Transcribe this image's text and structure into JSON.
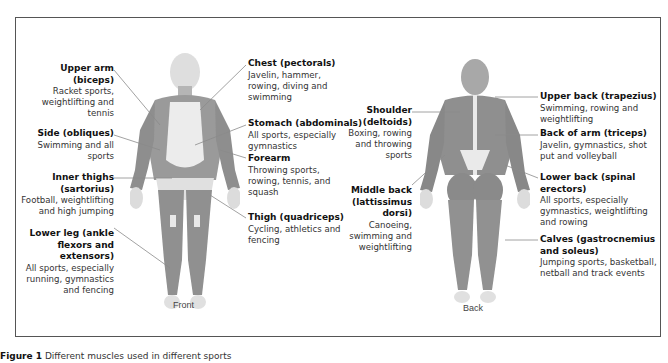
{
  "figure": {
    "views": {
      "front": "Front",
      "back": "Back"
    },
    "caption": {
      "label": "Figure 1",
      "text": "Different muscles used in different sports"
    }
  },
  "front_labels": [
    {
      "id": "upper-arm",
      "title": "Upper arm (biceps)",
      "desc": "Racket sports, weightlifting and tennis"
    },
    {
      "id": "side",
      "title": "Side (obliques)",
      "desc": "Swimming and all sports"
    },
    {
      "id": "inner-thighs",
      "title": "Inner thighs (sartorius)",
      "desc": "Football, weightlifting and high jumping"
    },
    {
      "id": "lower-leg",
      "title": "Lower leg (ankle flexors and extensors)",
      "desc": "All sports, especially running, gymnastics and fencing"
    },
    {
      "id": "chest",
      "title": "Chest (pectorals)",
      "desc": "Javelin, hammer, rowing, diving and swimming"
    },
    {
      "id": "stomach",
      "title": "Stomach (abdominals)",
      "desc": "All sports, especially gymnastics"
    },
    {
      "id": "forearm",
      "title": "Forearm",
      "desc": "Throwing sports, rowing, tennis, and squash"
    },
    {
      "id": "thigh",
      "title": "Thigh (quadriceps)",
      "desc": "Cycling, athletics and fencing"
    }
  ],
  "back_labels": [
    {
      "id": "shoulder",
      "title": "Shoulder (deltoids)",
      "desc": "Boxing, rowing and throwing sports"
    },
    {
      "id": "middle-back",
      "title": "Middle back (lattissimus dorsi)",
      "desc": "Canoeing, swimming and weightlifting"
    },
    {
      "id": "upper-back",
      "title": "Upper back (trapezius)",
      "desc": "Swimming, rowing and weightlifting"
    },
    {
      "id": "back-of-arm",
      "title": "Back of arm (triceps)",
      "desc": "Javelin, gymnastics, shot put and volleyball"
    },
    {
      "id": "lower-back",
      "title": "Lower back (spinal erectors)",
      "desc": "All sports, especially gymnastics, weightlifting and rowing"
    },
    {
      "id": "calves",
      "title": "Calves (gastrocnemius and soleus)",
      "desc": "Jumping sports, basketball, netball and track events"
    }
  ],
  "colors": {
    "muscle": "#9a9a9a",
    "muscle_dark": "#7d7d7d",
    "tendon": "#e6e6e6",
    "head_front": "#dcdcdc",
    "head_back": "#a8a8a8",
    "leader": "#8a8a8a",
    "frame": "#555555"
  }
}
